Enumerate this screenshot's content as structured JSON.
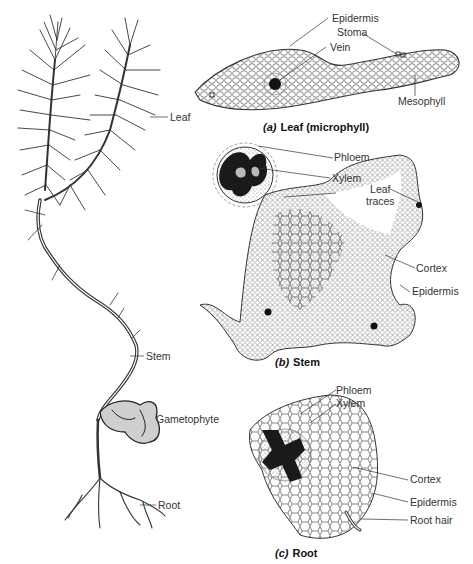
{
  "figure": {
    "plant_labels": {
      "leaf": "Leaf",
      "stem": "Stem",
      "gametophyte": "Gametophyte",
      "root": "Root"
    },
    "panels": [
      {
        "letter": "(a)",
        "title": "Leaf (microphyll)",
        "labels": {
          "epidermis": "Epidermis",
          "stoma": "Stoma",
          "vein": "Vein",
          "mesophyll": "Mesophyll"
        }
      },
      {
        "letter": "(b)",
        "title": "Stem",
        "labels": {
          "phloem": "Phloem",
          "xylem": "Xylem",
          "leaf_traces": "Leaf traces",
          "leaf_traces_line1": "Leaf",
          "leaf_traces_line2": "traces",
          "cortex": "Cortex",
          "epidermis": "Epidermis"
        }
      },
      {
        "letter": "(c)",
        "title": "Root",
        "labels": {
          "phloem": "Phloem",
          "xylem": "Xylem",
          "cortex": "Cortex",
          "epidermis": "Epidermis",
          "root_hair": "Root hair"
        }
      }
    ]
  }
}
